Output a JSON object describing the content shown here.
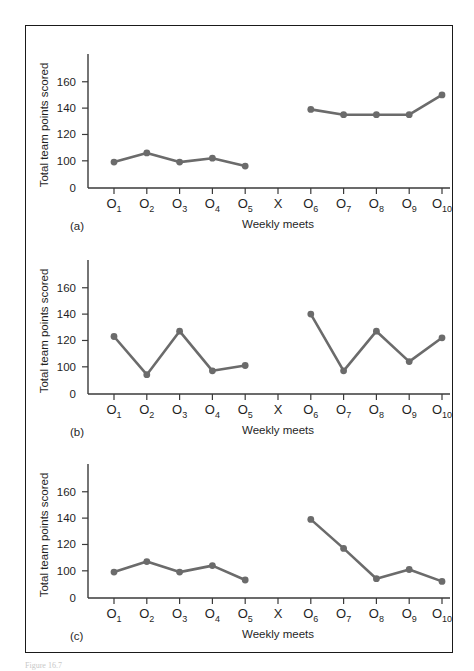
{
  "figure": {
    "caption": "Figure 16.7",
    "panels": [
      {
        "tag": "(a)"
      },
      {
        "tag": "(b)"
      },
      {
        "tag": "(c)"
      }
    ]
  },
  "axes": {
    "ylabel": "Total team points scored",
    "xlabel": "Weekly meets",
    "yticks": [
      "0",
      "100",
      "120",
      "140",
      "160"
    ],
    "xticks": [
      {
        "base": "O",
        "sub": "1"
      },
      {
        "base": "O",
        "sub": "2"
      },
      {
        "base": "O",
        "sub": "3"
      },
      {
        "base": "O",
        "sub": "4"
      },
      {
        "base": "O",
        "sub": "5"
      },
      {
        "base": "X",
        "sub": ""
      },
      {
        "base": "O",
        "sub": "6"
      },
      {
        "base": "O",
        "sub": "7"
      },
      {
        "base": "O",
        "sub": "8"
      },
      {
        "base": "O",
        "sub": "9"
      },
      {
        "base": "O",
        "sub": "10"
      }
    ]
  },
  "colors": {
    "line": "#6b6b6b",
    "axis": "#3a3a3a",
    "frame": "#1a1a1a",
    "text": "#1f1f1f"
  },
  "chart_data": [
    {
      "type": "line",
      "title": "(a)",
      "xlabel": "Weekly meets",
      "ylabel": "Total team points scored",
      "ylim": [
        0,
        175
      ],
      "ytick_values": [
        0,
        100,
        120,
        140,
        160
      ],
      "grid": false,
      "legend": "none",
      "x": [
        "O1",
        "O2",
        "O3",
        "O4",
        "O5",
        "X",
        "O6",
        "O7",
        "O8",
        "O9",
        "O10"
      ],
      "series": [
        {
          "name": "baseline",
          "x": [
            "O1",
            "O2",
            "O3",
            "O4",
            "O5"
          ],
          "values": [
            99,
            106,
            99,
            102,
            96
          ]
        },
        {
          "name": "post-intervention",
          "x": [
            "O6",
            "O7",
            "O8",
            "O9",
            "O10"
          ],
          "values": [
            139,
            135,
            135,
            135,
            150
          ]
        }
      ],
      "annotations": [
        "X marks the intervention; no data plotted at X"
      ]
    },
    {
      "type": "line",
      "title": "(b)",
      "xlabel": "Weekly meets",
      "ylabel": "Total team points scored",
      "ylim": [
        0,
        175
      ],
      "ytick_values": [
        0,
        100,
        120,
        140,
        160
      ],
      "grid": false,
      "legend": "none",
      "x": [
        "O1",
        "O2",
        "O3",
        "O4",
        "O5",
        "X",
        "O6",
        "O7",
        "O8",
        "O9",
        "O10"
      ],
      "series": [
        {
          "name": "baseline",
          "x": [
            "O1",
            "O2",
            "O3",
            "O4",
            "O5"
          ],
          "values": [
            123,
            94,
            127,
            97,
            101
          ]
        },
        {
          "name": "post-intervention",
          "x": [
            "O6",
            "O7",
            "O8",
            "O9",
            "O10"
          ],
          "values": [
            140,
            97,
            127,
            104,
            122
          ]
        }
      ],
      "annotations": [
        "X marks the intervention; no data plotted at X"
      ]
    },
    {
      "type": "line",
      "title": "(c)",
      "xlabel": "Weekly meets",
      "ylabel": "Total team points scored",
      "ylim": [
        0,
        175
      ],
      "ytick_values": [
        0,
        100,
        120,
        140,
        160
      ],
      "grid": false,
      "legend": "none",
      "x": [
        "O1",
        "O2",
        "O3",
        "O4",
        "O5",
        "X",
        "O6",
        "O7",
        "O8",
        "O9",
        "O10"
      ],
      "series": [
        {
          "name": "baseline",
          "x": [
            "O1",
            "O2",
            "O3",
            "O4",
            "O5"
          ],
          "values": [
            99,
            107,
            99,
            104,
            93
          ]
        },
        {
          "name": "post-intervention",
          "x": [
            "O6",
            "O7",
            "O8",
            "O9",
            "O10"
          ],
          "values": [
            139,
            117,
            94,
            101,
            92
          ]
        }
      ],
      "annotations": [
        "X marks the intervention; no data plotted at X"
      ]
    }
  ]
}
